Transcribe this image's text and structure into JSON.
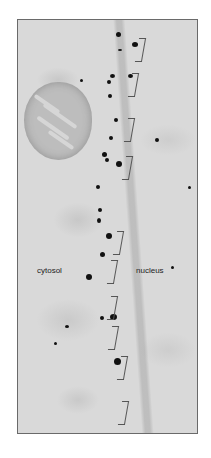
{
  "figure": {
    "type": "electron micrograph",
    "labels": {
      "cytosol": "cytosol",
      "nucleus": "nucleus"
    },
    "bracket_count": 10
  }
}
